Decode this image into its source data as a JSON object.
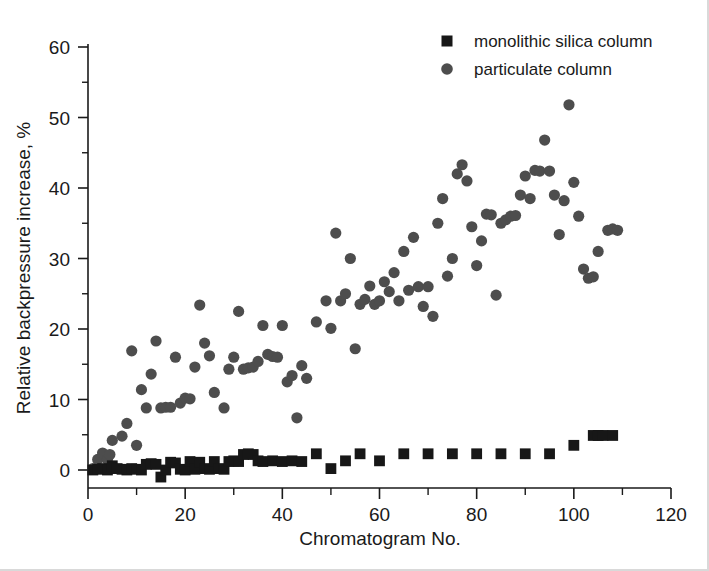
{
  "chart_data": {
    "type": "scatter",
    "title": "",
    "xlabel": "Chromatogram No.",
    "ylabel": "Relative backpressure increase, %",
    "xlim": [
      0,
      120
    ],
    "ylim": [
      -2,
      60
    ],
    "xticks": [
      0,
      20,
      40,
      60,
      80,
      100,
      120
    ],
    "yticks": [
      0,
      10,
      20,
      30,
      40,
      50,
      60
    ],
    "xtick_labels": [
      "0",
      "20",
      "40",
      "60",
      "80",
      "100",
      "120"
    ],
    "ytick_labels": [
      "0",
      "10",
      "20",
      "30",
      "40",
      "50",
      "60"
    ],
    "minor_ticks": true,
    "grid": false,
    "legend_position": "top-right",
    "series": [
      {
        "name": "monolithic silica column",
        "marker": "square",
        "color": "#171717",
        "points": [
          [
            1,
            0.0
          ],
          [
            2,
            0.1
          ],
          [
            3,
            0.2
          ],
          [
            4,
            0.0
          ],
          [
            5,
            0.6
          ],
          [
            6,
            0.2
          ],
          [
            7,
            0.1
          ],
          [
            8,
            0.0
          ],
          [
            9,
            0.2
          ],
          [
            10,
            0.1
          ],
          [
            11,
            0.0
          ],
          [
            12,
            0.8
          ],
          [
            13,
            0.9
          ],
          [
            14,
            0.8
          ],
          [
            15,
            -1.0
          ],
          [
            16,
            0.0
          ],
          [
            17,
            1.1
          ],
          [
            18,
            1.0
          ],
          [
            19,
            0.1
          ],
          [
            20,
            0.0
          ],
          [
            21,
            1.2
          ],
          [
            22,
            0.1
          ],
          [
            23,
            1.1
          ],
          [
            24,
            0.2
          ],
          [
            25,
            0.1
          ],
          [
            26,
            1.2
          ],
          [
            27,
            0.2
          ],
          [
            28,
            0.1
          ],
          [
            29,
            1.2
          ],
          [
            30,
            1.3
          ],
          [
            31,
            1.2
          ],
          [
            32,
            2.2
          ],
          [
            33,
            2.3
          ],
          [
            34,
            2.2
          ],
          [
            35,
            1.3
          ],
          [
            36,
            1.2
          ],
          [
            38,
            1.3
          ],
          [
            40,
            1.2
          ],
          [
            42,
            1.3
          ],
          [
            44,
            1.2
          ],
          [
            47,
            2.3
          ],
          [
            50,
            0.2
          ],
          [
            53,
            1.3
          ],
          [
            56,
            2.3
          ],
          [
            60,
            1.3
          ],
          [
            65,
            2.3
          ],
          [
            70,
            2.3
          ],
          [
            75,
            2.3
          ],
          [
            80,
            2.3
          ],
          [
            85,
            2.3
          ],
          [
            90,
            2.3
          ],
          [
            95,
            2.3
          ],
          [
            100,
            3.5
          ],
          [
            104,
            4.9
          ],
          [
            105,
            4.9
          ],
          [
            106,
            4.9
          ],
          [
            108,
            4.9
          ]
        ]
      },
      {
        "name": "particulate column",
        "marker": "circle",
        "color": "#4d4d4d",
        "points": [
          [
            1,
            0.2
          ],
          [
            2,
            1.5
          ],
          [
            3,
            2.4
          ],
          [
            4,
            1.5
          ],
          [
            4.5,
            2.2
          ],
          [
            5,
            4.2
          ],
          [
            7,
            4.8
          ],
          [
            8,
            6.6
          ],
          [
            9,
            16.9
          ],
          [
            10,
            3.5
          ],
          [
            11,
            11.4
          ],
          [
            12,
            8.8
          ],
          [
            13,
            13.6
          ],
          [
            14,
            18.3
          ],
          [
            15,
            8.8
          ],
          [
            16,
            8.9
          ],
          [
            17,
            8.9
          ],
          [
            18,
            16.0
          ],
          [
            19,
            9.5
          ],
          [
            20,
            10.2
          ],
          [
            21,
            10.1
          ],
          [
            22,
            14.6
          ],
          [
            23,
            23.4
          ],
          [
            24,
            18.0
          ],
          [
            25,
            16.2
          ],
          [
            26,
            11.0
          ],
          [
            28,
            8.8
          ],
          [
            29,
            14.3
          ],
          [
            30,
            16.0
          ],
          [
            31,
            22.5
          ],
          [
            32,
            14.3
          ],
          [
            33,
            14.5
          ],
          [
            34,
            14.6
          ],
          [
            35,
            15.4
          ],
          [
            36,
            20.5
          ],
          [
            37,
            16.4
          ],
          [
            38,
            16.1
          ],
          [
            39,
            16.0
          ],
          [
            40,
            20.5
          ],
          [
            41,
            12.5
          ],
          [
            42,
            13.4
          ],
          [
            43,
            7.4
          ],
          [
            44,
            14.8
          ],
          [
            45,
            13.0
          ],
          [
            47,
            21.0
          ],
          [
            49,
            24.0
          ],
          [
            50,
            20.1
          ],
          [
            51,
            33.6
          ],
          [
            52,
            24.0
          ],
          [
            53,
            25.0
          ],
          [
            54,
            30.0
          ],
          [
            55,
            17.2
          ],
          [
            56,
            23.5
          ],
          [
            57,
            24.2
          ],
          [
            58,
            26.1
          ],
          [
            59,
            23.5
          ],
          [
            60,
            24.0
          ],
          [
            61,
            26.7
          ],
          [
            62,
            25.3
          ],
          [
            63,
            28.0
          ],
          [
            64,
            24.0
          ],
          [
            65,
            31.0
          ],
          [
            66,
            25.5
          ],
          [
            67,
            33.0
          ],
          [
            68,
            26.0
          ],
          [
            69,
            23.2
          ],
          [
            70,
            26.0
          ],
          [
            71,
            21.8
          ],
          [
            72,
            35.0
          ],
          [
            73,
            38.5
          ],
          [
            74,
            27.5
          ],
          [
            75,
            30.0
          ],
          [
            76,
            42.0
          ],
          [
            77,
            43.3
          ],
          [
            78,
            41.0
          ],
          [
            79,
            34.5
          ],
          [
            80,
            29.0
          ],
          [
            81,
            32.5
          ],
          [
            82,
            36.3
          ],
          [
            83,
            36.2
          ],
          [
            84,
            24.8
          ],
          [
            85,
            35.0
          ],
          [
            86,
            35.5
          ],
          [
            87,
            36.0
          ],
          [
            88,
            36.1
          ],
          [
            89,
            39.0
          ],
          [
            90,
            41.7
          ],
          [
            91,
            38.5
          ],
          [
            92,
            42.5
          ],
          [
            93,
            42.4
          ],
          [
            94,
            46.8
          ],
          [
            95,
            42.4
          ],
          [
            96,
            39.0
          ],
          [
            97,
            33.4
          ],
          [
            98,
            38.2
          ],
          [
            99,
            51.8
          ],
          [
            100,
            40.8
          ],
          [
            101,
            36.0
          ],
          [
            102,
            28.5
          ],
          [
            103,
            27.2
          ],
          [
            104,
            27.4
          ],
          [
            105,
            31.0
          ],
          [
            107,
            34.0
          ],
          [
            108,
            34.2
          ],
          [
            109,
            34.0
          ]
        ]
      }
    ],
    "legend": [
      {
        "label": "monolithic silica column",
        "marker": "square",
        "color": "#171717"
      },
      {
        "label": "particulate column",
        "marker": "circle",
        "color": "#4d4d4d"
      }
    ]
  }
}
